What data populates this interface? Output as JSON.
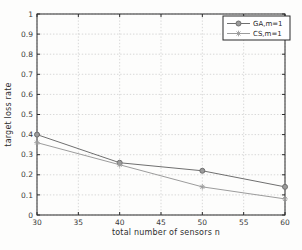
{
  "figure": {
    "background": "#fdfdfc",
    "axis_color": "#2b2b2b",
    "grid_color": "#c9c9c9",
    "tick_label_color": "#3a3a3a",
    "legend_border_color": "#2b2b2b",
    "legend_background": "#ffffff"
  },
  "chart_data": {
    "type": "line",
    "x": [
      30,
      40,
      50,
      60
    ],
    "series": [
      {
        "name": "GA,m=1",
        "values": [
          0.4,
          0.26,
          0.22,
          0.14
        ],
        "color": "#6f6f6f",
        "marker": "circle"
      },
      {
        "name": "CS,m=1",
        "values": [
          0.36,
          0.25,
          0.14,
          0.08
        ],
        "color": "#9c9c9c",
        "marker": "asterisk"
      }
    ],
    "title": "",
    "xlabel": "total number of sensors n",
    "ylabel": "target loss rate",
    "xlim": [
      30,
      60
    ],
    "ylim": [
      0,
      1
    ],
    "xticks": [
      30,
      35,
      40,
      45,
      50,
      55,
      60
    ],
    "yticks": [
      0,
      0.1,
      0.2,
      0.3,
      0.4,
      0.5,
      0.6,
      0.7,
      0.8,
      0.9,
      1
    ],
    "grid": true,
    "legend": {
      "position": "top-right",
      "entries": [
        "GA,m=1",
        "CS,m=1"
      ]
    }
  }
}
